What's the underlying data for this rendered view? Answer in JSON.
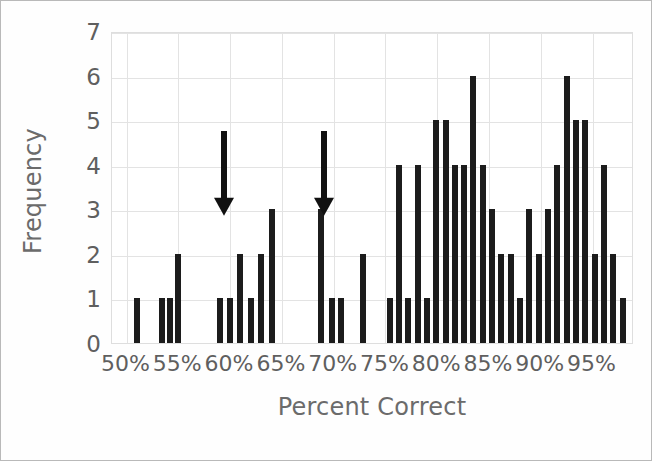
{
  "chart_data": {
    "type": "bar",
    "title": "",
    "subtitle": "",
    "xlabel": "Percent Correct",
    "ylabel": "Frequency",
    "xtick_labels": [
      "50%",
      "55%",
      "60%",
      "65%",
      "70%",
      "75%",
      "80%",
      "85%",
      "90%",
      "95%"
    ],
    "xtick_values": [
      50,
      55,
      60,
      65,
      70,
      75,
      80,
      85,
      90,
      95
    ],
    "ytick_labels": [
      "0",
      "1",
      "2",
      "3",
      "4",
      "5",
      "6",
      "7"
    ],
    "ylim": [
      0,
      7
    ],
    "xlim": [
      48.6,
      99.0
    ],
    "grid": true,
    "legend": null,
    "bar_color": "#1c1c1c",
    "x": [
      51.0,
      53.4,
      54.2,
      55.0,
      59.0,
      60.0,
      61.0,
      62.0,
      63.0,
      64.0,
      68.8,
      69.8,
      70.7,
      72.8,
      75.4,
      76.3,
      77.2,
      78.1,
      79.0,
      79.9,
      80.8,
      81.7,
      82.6,
      83.5,
      84.4,
      85.3,
      86.2,
      87.1,
      88.0,
      88.9,
      89.8,
      90.7,
      91.6,
      92.5,
      93.4,
      94.3,
      95.2,
      96.1,
      97.0,
      97.9
    ],
    "values": [
      1,
      1,
      1,
      2,
      1,
      1,
      2,
      1,
      2,
      3,
      3,
      1,
      1,
      2,
      1,
      4,
      1,
      4,
      1,
      5,
      5,
      4,
      4,
      6,
      4,
      3,
      2,
      2,
      1,
      3,
      2,
      3,
      4,
      6,
      5,
      5,
      2,
      4,
      2,
      1
    ],
    "annotations": [
      {
        "type": "arrow",
        "label": "arrow-marker-1",
        "x": 59.4,
        "y_from": 4.8,
        "y_to": 2.9,
        "color": "#111111"
      },
      {
        "type": "arrow",
        "label": "arrow-marker-2",
        "x": 69.1,
        "y_from": 4.8,
        "y_to": 2.9,
        "color": "#111111"
      }
    ]
  },
  "axis": {
    "ylabel": "Frequency",
    "xlabel": "Percent Correct"
  }
}
